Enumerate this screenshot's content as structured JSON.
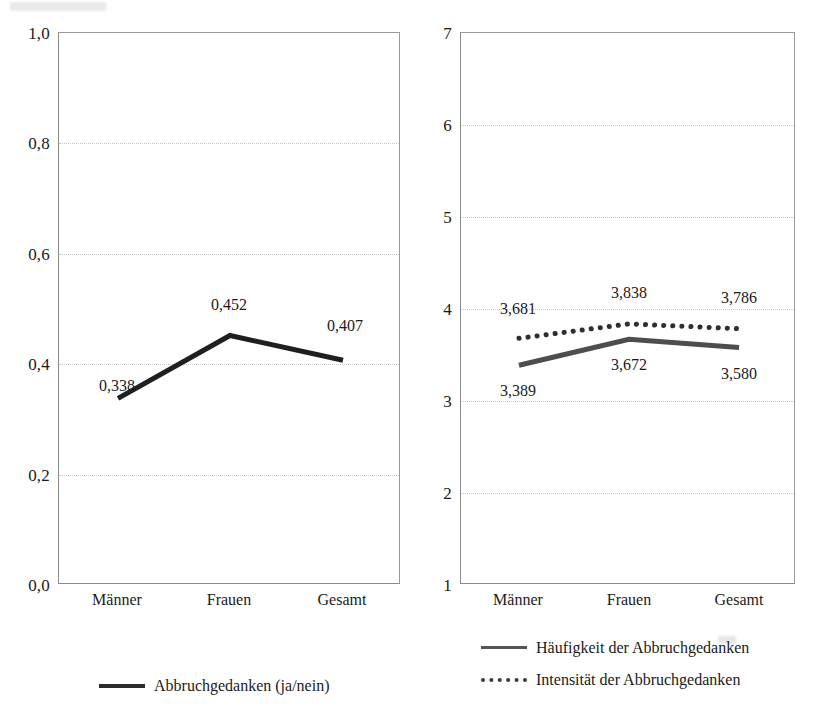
{
  "figure": {
    "background_color": "#ffffff",
    "ink_color": "#1a1a1a",
    "gridline_color": "#c6c6c6",
    "axis_color": "#8b8b8b"
  },
  "chart_data": [
    {
      "id": "left",
      "type": "line",
      "title": "",
      "xlabel": "",
      "ylabel": "",
      "categories": [
        "Männer",
        "Frauen",
        "Gesamt"
      ],
      "ylim": [
        0.0,
        1.0
      ],
      "yticks": [
        "0,0",
        "0,2",
        "0,4",
        "0,6",
        "0,8",
        "1,0"
      ],
      "ytick_values": [
        0.0,
        0.2,
        0.4,
        0.6,
        0.8,
        1.0
      ],
      "grid": true,
      "legend_position": "bottom",
      "series": [
        {
          "name": "Abbruchgedanken (ja/nein)",
          "style": "solid",
          "color": "#1f1f1f",
          "width": 4,
          "values": [
            0.338,
            0.452,
            0.407
          ],
          "labels": [
            "0,338",
            "0,452",
            "0,407"
          ],
          "label_placement": [
            "below-left",
            "above",
            "above-right"
          ]
        }
      ]
    },
    {
      "id": "right",
      "type": "line",
      "title": "",
      "xlabel": "",
      "ylabel": "",
      "categories": [
        "Männer",
        "Frauen",
        "Gesamt"
      ],
      "ylim": [
        1,
        7
      ],
      "yticks": [
        "1",
        "2",
        "3",
        "4",
        "5",
        "6",
        "7"
      ],
      "ytick_values": [
        1,
        2,
        3,
        4,
        5,
        6,
        7
      ],
      "grid": true,
      "legend_position": "bottom",
      "series": [
        {
          "name": "Häufigkeit der Abbruchgedanken",
          "style": "solid",
          "color": "#4d4d4d",
          "width": 4,
          "values": [
            3.389,
            3.672,
            3.58
          ],
          "labels": [
            "3,389",
            "3,672",
            "3,580"
          ],
          "label_placement": [
            "below-left",
            "below",
            "below-right"
          ]
        },
        {
          "name": "Intensität der Abbruchgedanken",
          "style": "dotted",
          "color": "#2e2e2e",
          "width": 4,
          "values": [
            3.681,
            3.838,
            3.786
          ],
          "labels": [
            "3,681",
            "3,838",
            "3,786"
          ],
          "label_placement": [
            "above-left",
            "above",
            "above-right"
          ]
        }
      ]
    }
  ],
  "left_chart": {
    "yticks": [
      "1,0",
      "0,8",
      "0,6",
      "0,4",
      "0,2",
      "0,0"
    ],
    "xticks": [
      "Männer",
      "Frauen",
      "Gesamt"
    ],
    "labels": [
      "0,338",
      "0,452",
      "0,407"
    ],
    "legend": [
      {
        "label": "Abbruchgedanken (ja/nein)",
        "style": "solid"
      }
    ]
  },
  "right_chart": {
    "yticks": [
      "7",
      "6",
      "5",
      "4",
      "3",
      "2",
      "1"
    ],
    "xticks": [
      "Männer",
      "Frauen",
      "Gesamt"
    ],
    "labels_haeufigkeit": [
      "3,389",
      "3,672",
      "3,580"
    ],
    "labels_intensitaet": [
      "3,681",
      "3,838",
      "3,786"
    ],
    "legend": [
      {
        "label": "Häufigkeit der Abbruchgedanken",
        "style": "solid"
      },
      {
        "label": "Intensität der Abbruchgedanken",
        "style": "dotted"
      }
    ]
  }
}
